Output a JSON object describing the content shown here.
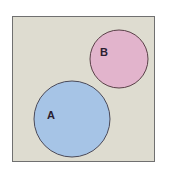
{
  "diagram": {
    "type": "venn",
    "universal_set": {
      "x": 12,
      "y": 16,
      "width": 143,
      "height": 146,
      "fill": "#dedcd0",
      "stroke": "#707070"
    },
    "sets": [
      {
        "label": "A",
        "cx": 72,
        "cy": 119,
        "r": 38,
        "fill": "#a6c4e6",
        "stroke": "#4a4a5a",
        "label_x": 50,
        "label_y": 119
      },
      {
        "label": "B",
        "cx": 119,
        "cy": 59,
        "r": 29,
        "fill": "#e2b4cc",
        "stroke": "#5a4048",
        "label_x": 104,
        "label_y": 56
      }
    ],
    "relationship": "disjoint"
  }
}
